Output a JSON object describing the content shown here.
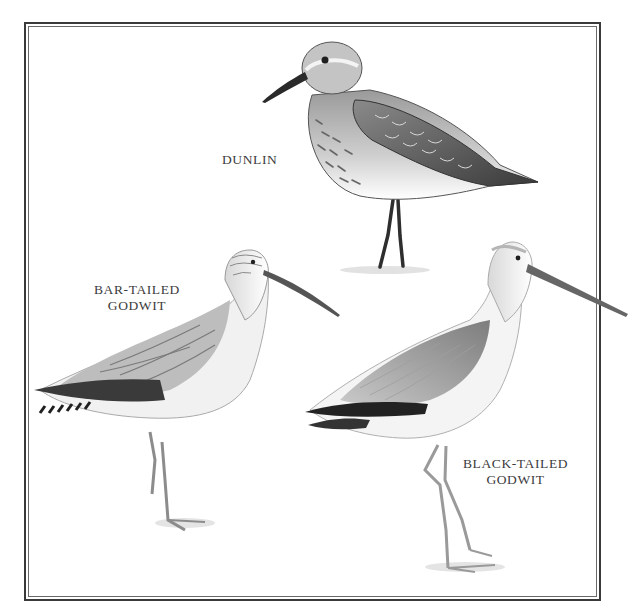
{
  "plate": {
    "frame": {
      "style": "double-rule border",
      "outer_color": "#3a3a3a",
      "inner_color": "#6a6a6a"
    },
    "birds": [
      {
        "id": "dunlin",
        "label_lines": [
          "DUNLIN"
        ]
      },
      {
        "id": "bar-tailed-godwit",
        "label_lines": [
          "BAR-TAILED",
          "GODWIT"
        ]
      },
      {
        "id": "black-tailed-godwit",
        "label_lines": [
          "BLACK-TAILED",
          "GODWIT"
        ]
      }
    ]
  },
  "colors": {
    "background": "#ffffff",
    "ink_dark": "#2a2a2a",
    "ink_mid": "#6e6e6e",
    "ink_light": "#b8b8b8",
    "label_text": "#3c3c3c"
  }
}
